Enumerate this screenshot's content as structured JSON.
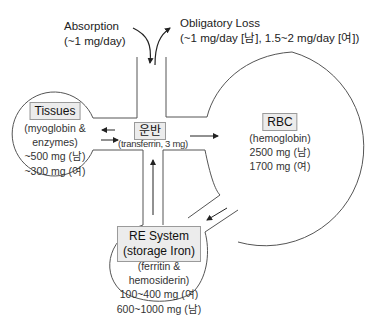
{
  "absorption": {
    "title": "Absorption",
    "value": "(~1 mg/day)"
  },
  "obligatory_loss": {
    "title": "Obligatory Loss",
    "value": "(~1 mg/day [남], 1.5~2 mg/day [여])"
  },
  "transport": {
    "title": "운반",
    "subtitle": "(transferrin, 3 mg)"
  },
  "tissues": {
    "title": "Tissues",
    "lines": [
      "(myoglobin &",
      "enzymes)",
      "~500 mg (남)",
      "~300 mg (여)"
    ]
  },
  "rbc": {
    "title": "RBC",
    "lines": [
      "(hemoglobin)",
      "2500 mg (남)",
      "1700 mg (여)"
    ]
  },
  "re_system": {
    "title_line1": "RE System",
    "title_line2": "(storage Iron)",
    "lines": [
      "(ferritin &",
      "hemosiderin)",
      "100~400 mg (여)",
      "600~1000 mg (남)"
    ]
  },
  "colors": {
    "stroke": "#555555",
    "box_fill": "#ececec",
    "text": "#222222"
  }
}
